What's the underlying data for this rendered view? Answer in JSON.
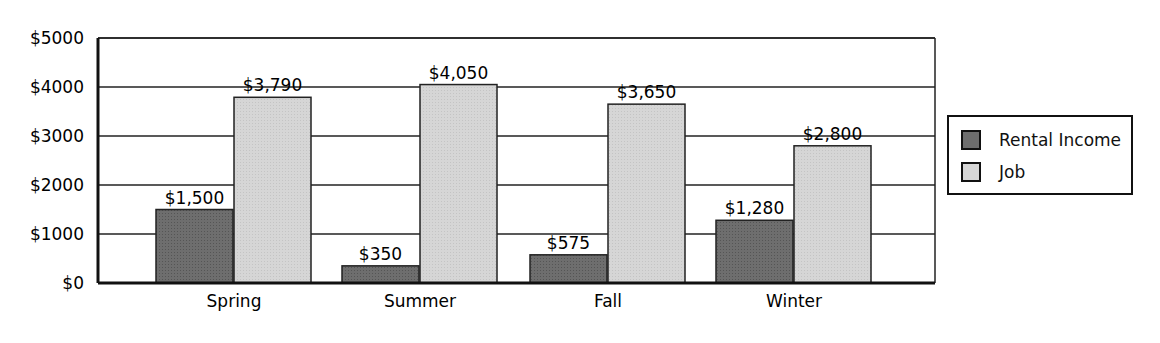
{
  "chart_data": {
    "type": "bar",
    "title": "",
    "xlabel": "",
    "ylabel": "",
    "categories": [
      "Spring",
      "Summer",
      "Fall",
      "Winter"
    ],
    "series": [
      {
        "name": "Rental Income",
        "values": [
          1500,
          350,
          575,
          1280
        ],
        "labels": [
          "$1,500",
          "$350",
          "$575",
          "$1,280"
        ],
        "color": "#6e6e6e"
      },
      {
        "name": "Job",
        "values": [
          3790,
          4050,
          3650,
          2800
        ],
        "labels": [
          "$3,790",
          "$4,050",
          "$3,650",
          "$2,800"
        ],
        "color": "#d6d6d6"
      }
    ],
    "ylim": [
      0,
      5000
    ],
    "yticks": [
      0,
      1000,
      2000,
      3000,
      4000,
      5000
    ],
    "ytick_labels": [
      "$0",
      "$1000",
      "$2000",
      "$3000",
      "$4000",
      "$5000"
    ],
    "grid": true,
    "legend_position": "right"
  },
  "legend": {
    "items": [
      {
        "label": "Rental Income",
        "color": "#6e6e6e"
      },
      {
        "label": "Job",
        "color": "#d6d6d6"
      }
    ]
  }
}
